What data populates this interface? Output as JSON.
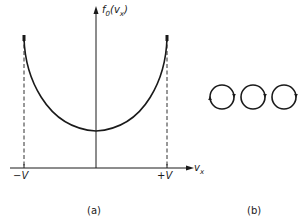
{
  "figure": {
    "panel_a": {
      "y_axis_label_main": "f",
      "y_axis_label_sub": "0",
      "y_axis_label_arg_open": "(v",
      "y_axis_label_arg_sub": "x",
      "y_axis_label_arg_close": ")",
      "x_axis_label_main": "v",
      "x_axis_label_sub": "x",
      "tick_negative": "−V",
      "tick_positive": "+V",
      "caption": "(a)",
      "curve_description": "U-shaped distribution, minimum at v_x = 0, diverging at ±V",
      "line_color": "#1a1a1a"
    },
    "panel_b": {
      "caption": "(b)",
      "circle_count": 3,
      "circle_description": "three adjacent circular orbits with direction arrows"
    }
  }
}
